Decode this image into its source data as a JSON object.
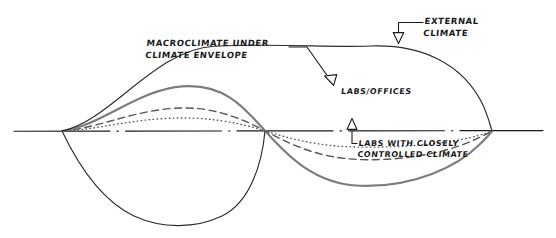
{
  "diagram": {
    "style": "hand-drawn sketch, black ink on white",
    "labels": {
      "macroclimate": "MACROCLIMATE UNDER\nCLIMATE ENVELOPE",
      "external": "EXTERNAL\nCLIMATE",
      "labs_offices": "LABS/OFFICES",
      "controlled": "LABS WITH CLOSELY\nCONTROLLED CLIMATE"
    },
    "axis": {
      "name": "baseline-axis",
      "style": "dash-dot",
      "color": "#1a1a1a",
      "y": 131,
      "x_start": 14,
      "x_end": 543
    },
    "curves": [
      {
        "name": "external-climate-curve",
        "label": "EXTERNAL CLIMATE",
        "style": "solid-thin",
        "color": "#2b2b2b",
        "stroke_width": 1.1,
        "amplitude_up": 85,
        "amplitude_down": 94,
        "peak_y": 46,
        "trough_y": 225
      },
      {
        "name": "macroclimate-curve",
        "label": "MACROCLIMATE UNDER CLIMATE ENVELOPE",
        "style": "solid-thick-grey",
        "color": "#7c7c7c",
        "stroke_width": 2.1,
        "amplitude_up": 45,
        "amplitude_down": 55,
        "peak_y": 86,
        "trough_y": 186
      },
      {
        "name": "labs-offices-curve",
        "label": "LABS/OFFICES",
        "style": "dashed",
        "color": "#565656",
        "stroke_width": 1.3,
        "amplitude_up": 23,
        "amplitude_down": 29,
        "peak_y": 108,
        "trough_y": 160
      },
      {
        "name": "controlled-climate-curve",
        "label": "LABS WITH CLOSELY CONTROLLED CLIMATE",
        "style": "dotted",
        "color": "#565656",
        "stroke_width": 1.3,
        "amplitude_up": 13,
        "amplitude_down": 16,
        "peak_y": 118,
        "trough_y": 147
      }
    ],
    "nodes": {
      "left_crossing_x": 62,
      "mid_crossing_x": 265,
      "right_crossing_x": 492
    },
    "leaders": [
      {
        "name": "leader-macroclimate",
        "from": "MACROCLIMATE UNDER CLIMATE ENVELOPE",
        "to": "macroclimate-curve",
        "arrow": "open-triangle"
      },
      {
        "name": "leader-external",
        "from": "EXTERNAL CLIMATE",
        "to": "external-climate-curve",
        "arrow": "open-triangle"
      },
      {
        "name": "leader-controlled",
        "from": "LABS WITH CLOSELY CONTROLLED CLIMATE",
        "to": "controlled-climate-curve",
        "arrow": "open-triangle-up"
      }
    ]
  }
}
